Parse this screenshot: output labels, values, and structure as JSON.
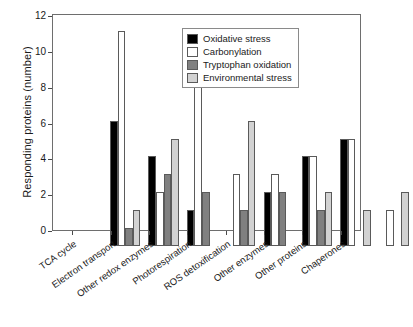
{
  "chart_data": {
    "type": "bar",
    "title": "",
    "xlabel": "",
    "ylabel": "Responding proteins (number)",
    "ylim": [
      0,
      12
    ],
    "yticks": [
      0,
      2,
      4,
      6,
      8,
      10,
      12
    ],
    "ytick_labels": [
      "0",
      "2",
      "4",
      "6",
      "8",
      "10",
      "12"
    ],
    "grid": false,
    "legend_position": "upper right",
    "categories": [
      "TCA cycle",
      "Electron transport",
      "Other redox enzymes",
      "Photorespiration",
      "ROS detoxification",
      "Other enzymes",
      "Other proteins",
      "Chaperones"
    ],
    "series": [
      {
        "name": "Oxidative stress",
        "color": "#000000",
        "values": [
          7,
          5,
          2,
          0,
          3,
          5,
          6,
          0
        ]
      },
      {
        "name": "Carbonylation",
        "color": "#ffffff",
        "values": [
          12,
          3,
          10,
          4,
          4,
          5,
          6,
          2
        ]
      },
      {
        "name": "Tryptophan oxidation",
        "color": "#808080",
        "values": [
          1,
          4,
          3,
          2,
          3,
          2,
          0,
          0
        ]
      },
      {
        "name": "Environmental stress",
        "color": "#d2d2d2",
        "values": [
          2,
          6,
          0,
          7,
          0,
          3,
          2,
          3
        ]
      }
    ]
  },
  "legend": {
    "entries": [
      {
        "label": "Oxidative stress",
        "color": "#000000"
      },
      {
        "label": "Carbonylation",
        "color": "#ffffff"
      },
      {
        "label": "Tryptophan oxidation",
        "color": "#808080"
      },
      {
        "label": "Environmental stress",
        "color": "#d2d2d2"
      }
    ]
  },
  "axes": {
    "y_title": "Responding proteins (number)",
    "frame_color": "#6e6e6e",
    "bar_edge_color": "#5a5a5a"
  }
}
